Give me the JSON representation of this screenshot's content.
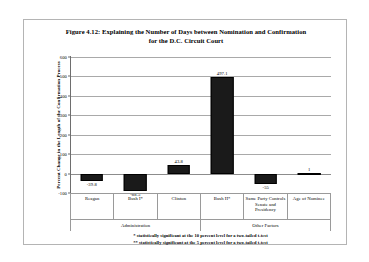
{
  "figure": {
    "title_line1": "Figure 4.12: Explaining the Number of Days between Nomination and Confirmation",
    "title_line2": "for the D.C. Circuit Court"
  },
  "footnotes": {
    "one_star": "* statistically significant at the 10 percent level for a two-tailed t-test",
    "two_star": "** statistically significant at the 5 percent level for a two-tailed t-test"
  },
  "groups": {
    "administration": "Administration",
    "other_factors": "Other Factors"
  },
  "chart_data": {
    "type": "bar",
    "title": "Figure 4.12: Explaining the Number of Days between Nomination and Confirmation for the D.C. Circuit Court",
    "xlabel": "",
    "ylabel": "Percent Change in the Length of the Confirmation Process",
    "categories": [
      "Reagan",
      "Bush I*",
      "Clinton",
      "Bush II*",
      "Same Party Controls Senate and Presidency",
      "Age of Nominee"
    ],
    "values": [
      -39.8,
      -88.5,
      43.8,
      497.1,
      -55,
      1
    ],
    "value_labels": [
      "-39.8",
      "-88.5",
      "43.8",
      "497.1",
      "-55",
      "1"
    ],
    "ylim": [
      -100,
      600
    ],
    "yticks": [
      -100,
      0,
      100,
      200,
      300,
      400,
      500,
      600
    ],
    "ytick_labels": [
      "-100",
      "0",
      "100",
      "200",
      "300",
      "400",
      "500",
      "600"
    ],
    "grid": true,
    "legend": "none",
    "bar_color": "#1a1a1a",
    "group_spans": [
      {
        "label": "Administration",
        "categories": [
          "Reagan",
          "Bush I*",
          "Clinton",
          "Bush II*"
        ]
      },
      {
        "label": "Other Factors",
        "categories": [
          "Same Party Controls Senate and Presidency",
          "Age of Nominee"
        ]
      }
    ]
  }
}
